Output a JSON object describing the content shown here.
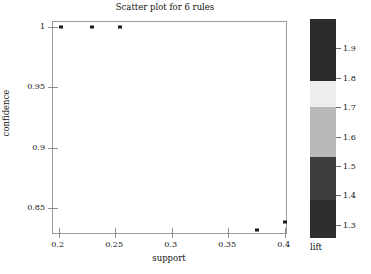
{
  "chart_data": {
    "type": "scatter",
    "title": "Scatter plot for 6 rules",
    "xlabel": "support",
    "ylabel": "confidence",
    "xlim": [
      0.195,
      0.403
    ],
    "ylim": [
      0.8275,
      1.004
    ],
    "grid": false,
    "xticks": [
      0.2,
      0.25,
      0.3,
      0.35,
      0.4
    ],
    "xtick_labels": [
      "0.2",
      "0.25",
      "0.3",
      "0.35",
      "0.4"
    ],
    "yticks": [
      0.85,
      0.9,
      0.95,
      1.0
    ],
    "ytick_labels": [
      "0.85",
      "0.9",
      "0.95",
      "1"
    ],
    "points": [
      {
        "support": 0.2025,
        "confidence": 1.0,
        "lift": 1.95,
        "color": "#1a1a1a"
      },
      {
        "support": 0.2295,
        "confidence": 1.0,
        "lift": 1.95,
        "color": "#1a1a1a"
      },
      {
        "support": 0.254,
        "confidence": 1.0,
        "lift": 1.95,
        "color": "#1a1a1a"
      },
      {
        "support": 0.3755,
        "confidence": 0.8315,
        "lift": 1.33,
        "color": "#1a1a1a"
      },
      {
        "support": 0.4,
        "confidence": 0.8385,
        "lift": 1.33,
        "color": "#1a1a1a"
      }
    ],
    "colorbar": {
      "title": "lift",
      "ticks": [
        1.3,
        1.4,
        1.5,
        1.6,
        1.7,
        1.8,
        1.9
      ],
      "tick_labels": [
        "1.3",
        "1.4",
        "1.5",
        "1.6",
        "1.7",
        "1.8",
        "1.9"
      ],
      "range": [
        1.255,
        2.0
      ],
      "bands": [
        {
          "from": 1.255,
          "to": 1.385,
          "color": "#2e2e2e"
        },
        {
          "from": 1.385,
          "to": 1.53,
          "color": "#3d3d3d"
        },
        {
          "from": 1.53,
          "to": 1.7,
          "color": "#b9b9b9"
        },
        {
          "from": 1.7,
          "to": 1.79,
          "color": "#ededed"
        },
        {
          "from": 1.79,
          "to": 2.0,
          "color": "#2b2b2b"
        }
      ]
    }
  }
}
